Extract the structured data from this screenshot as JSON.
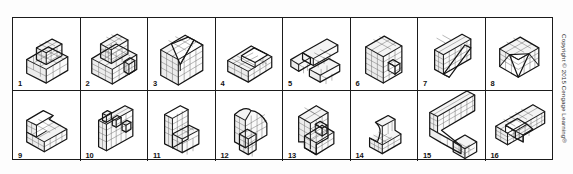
{
  "figure": {
    "kind": "isometric-block-objects-grid",
    "rows": 2,
    "columns": 8,
    "total_items": 16,
    "frame_color": "#1b1b1b",
    "background_color": "#ffffff",
    "shading_color": "#ececec",
    "grid_line_color": "#6e6e6e"
  },
  "copyright": {
    "text": "Copyright © 2015 Cengage Learning®",
    "orientation": "vertical",
    "position": "right-edge"
  },
  "items": [
    {
      "number": "1",
      "shape_name": "two-tier-stepped-block",
      "description": "Rectangular base block with a smaller cube stacked on the upper-left rear",
      "grid_faces": true
    },
    {
      "number": "2",
      "shape_name": "stepped-block-with-notch",
      "description": "Wide base block with a cube on top rear and a small notched step on the right front",
      "grid_faces": true
    },
    {
      "number": "3",
      "shape_name": "v-notched-block",
      "description": "Upright block with a large angled V-shaped wedge cut out of the top",
      "grid_faces": true
    },
    {
      "number": "4",
      "shape_name": "block-with-angled-slot",
      "description": "Low rectangular block with an inclined slot cut through the top face",
      "grid_faces": true
    },
    {
      "number": "5",
      "shape_name": "z-shaped-offset-bars",
      "description": "Flat Z / S arrangement of two offset rectangular bars joined by a plate",
      "grid_faces": true
    },
    {
      "number": "6",
      "shape_name": "c-channel-upright-block",
      "description": "Tall upright block with a rectangular pocket cut into the right face",
      "grid_faces": true
    },
    {
      "number": "7",
      "shape_name": "plate-with-diagonal-rib",
      "description": "Thin vertical plate with a diagonal rib running corner to corner",
      "grid_faces": true
    },
    {
      "number": "8",
      "shape_name": "cube-with-triangular-cut",
      "description": "Cube with a large triangular pyramid wedge cut from the front corner",
      "grid_faces": true
    },
    {
      "number": "9",
      "shape_name": "l-shaped-angled-block",
      "description": "L-shaped block with an angled upper surface and recessed inner corner",
      "grid_faces": true
    },
    {
      "number": "10",
      "shape_name": "wall-with-three-posts",
      "description": "Flat vertical wall with three square posts projecting from the top edge",
      "grid_faces": true
    },
    {
      "number": "11",
      "shape_name": "triangular-wall-with-step",
      "description": "Triangular upright plate with a small rectangular step block at the base front",
      "grid_faces": true
    },
    {
      "number": "12",
      "shape_name": "tall-block-with-curved-top",
      "description": "Tall upright block with a sloped/curved top and a narrow vertical rib in front",
      "grid_faces": true
    },
    {
      "number": "13",
      "shape_name": "stepped-c-bracket",
      "description": "C-shaped bracket with stepped ledges on the front face",
      "grid_faces": true
    },
    {
      "number": "14",
      "shape_name": "curved-seat-block",
      "description": "Small block with a concave curved cut forming a seat profile",
      "grid_faces": true
    },
    {
      "number": "15",
      "shape_name": "wall-with-angled-brace",
      "description": "Long vertical wall with an angled brace arm sloping down to the front",
      "grid_faces": true
    },
    {
      "number": "16",
      "shape_name": "long-u-channel",
      "description": "Long horizontal U-channel with an inner divider block",
      "grid_faces": true
    }
  ]
}
